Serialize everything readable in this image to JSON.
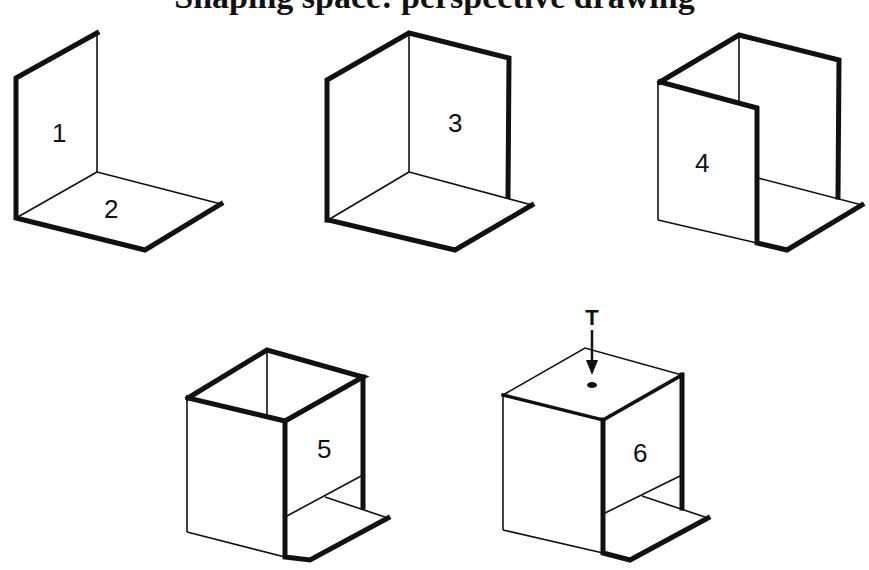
{
  "title": "Shaping space: perspective drawing",
  "figures": [
    {
      "id": 1,
      "label": "1",
      "description": "Single vertical plane"
    },
    {
      "id": 2,
      "label": "2",
      "description": "Horizontal base plane"
    },
    {
      "id": 3,
      "label": "3",
      "description": "Two vertical planes forming a corner on a base"
    },
    {
      "id": 4,
      "label": "4",
      "description": "Three vertical planes forming a U-shaped enclosure"
    },
    {
      "id": 5,
      "label": "5",
      "description": "Open-topped box with a low front opening"
    },
    {
      "id": 6,
      "label": "6",
      "description": "Closed box with a top opening and light entering"
    }
  ],
  "annotations": {
    "light_symbol": "T",
    "light_arrow": "downward arrow into top opening"
  },
  "colors": {
    "line": "#111111",
    "background": "#ffffff"
  }
}
